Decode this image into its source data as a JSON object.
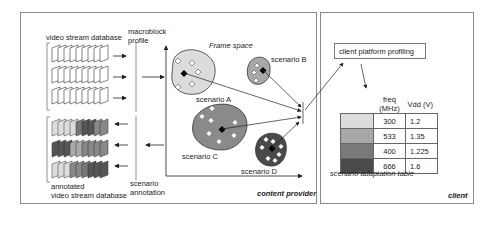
{
  "content_provider": {
    "label": "content provider",
    "video_db_label": "video stream database",
    "macroblock_label": [
      "macroblock",
      "profile"
    ],
    "annotated_db_label": [
      "annotated",
      "video stream database"
    ],
    "scenario_annotation_label": [
      "scenario",
      "annotation"
    ],
    "frame_space_label": "Frame space",
    "scenarios": [
      {
        "name": "scenario A",
        "color": "#dcdcdc"
      },
      {
        "name": "scenario B",
        "color": "#a8a8a8"
      },
      {
        "name": "scenario C",
        "color": "#8a8a8a"
      },
      {
        "name": "scenario D",
        "color": "#4a4a4a"
      }
    ]
  },
  "client": {
    "label": "client",
    "profiling_label": "client platform profiling",
    "table_caption": "scenario adaptation table",
    "table_headers": [
      "freq (MHz)",
      "Vdd (V)"
    ],
    "table_rows": [
      {
        "color": "#dcdcdc",
        "freq": "300",
        "vdd": "1.2"
      },
      {
        "color": "#a8a8a8",
        "freq": "533",
        "vdd": "1.35"
      },
      {
        "color": "#7a7a7a",
        "freq": "400",
        "vdd": "1.225"
      },
      {
        "color": "#4a4a4a",
        "freq": "666",
        "vdd": "1.6"
      }
    ]
  }
}
